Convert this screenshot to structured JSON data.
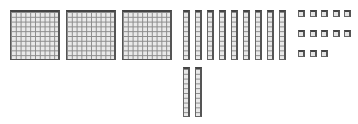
{
  "diagram": {
    "hundreds_flats": 3,
    "tens_rods_top": 9,
    "tens_rods_bottom": 2,
    "unit_cubes": 13,
    "unit_rows": [
      5,
      5,
      3
    ],
    "colors": {
      "fill": "#e9e9e9",
      "grid": "#8a8a8a",
      "edge": "#444444"
    }
  }
}
